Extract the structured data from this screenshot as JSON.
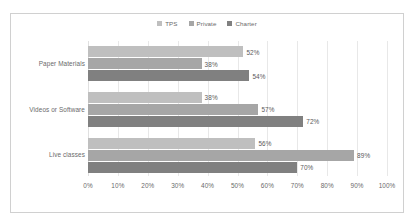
{
  "chart_data": {
    "type": "bar",
    "orientation": "horizontal",
    "title": "",
    "subtitle": "",
    "xlabel": "",
    "ylabel": "",
    "categories": [
      "Paper Materials",
      "Videos or Software",
      "Live classes"
    ],
    "series": [
      {
        "name": "TPS",
        "color": "#bfbfbf",
        "values": [
          52,
          38,
          56
        ],
        "labels": [
          "52%",
          "38%",
          "56%"
        ]
      },
      {
        "name": "Private",
        "color": "#a6a6a6",
        "values": [
          38,
          57,
          89
        ],
        "labels": [
          "38%",
          "57%",
          "89%"
        ]
      },
      {
        "name": "Charter",
        "color": "#808080",
        "values": [
          54,
          72,
          70
        ],
        "labels": [
          "54%",
          "72%",
          "70%"
        ]
      }
    ],
    "xlim": [
      0,
      100
    ],
    "xticks": [
      0,
      10,
      20,
      30,
      40,
      50,
      60,
      70,
      80,
      90,
      100
    ],
    "xticklabels": [
      "0%",
      "10%",
      "20%",
      "30%",
      "40%",
      "50%",
      "60%",
      "70%",
      "80%",
      "90%",
      "100%"
    ],
    "grid": true,
    "grid_axis": "x",
    "legend": true,
    "legend_position": "top",
    "value_labels": true,
    "plot_background": "#ffffff",
    "grid_color": "#e8e8e8",
    "text_color": "#6a6a6a",
    "border_color": "#d0d0d0"
  },
  "legend": {
    "entries": [
      {
        "label": "TPS",
        "marker": "legend-swatch-tps"
      },
      {
        "label": "Private",
        "marker": "legend-swatch-private"
      },
      {
        "label": "Charter",
        "marker": "legend-swatch-charter"
      }
    ]
  }
}
